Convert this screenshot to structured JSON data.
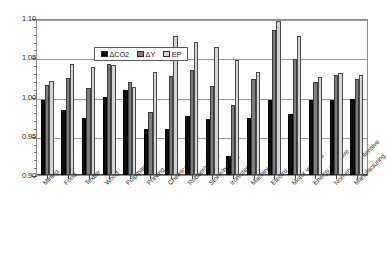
{
  "chart_data": {
    "type": "bar",
    "title": "",
    "xlabel": "",
    "ylabel": "",
    "ylim": [
      0.9,
      1.1
    ],
    "ytick_labels": [
      "1.10",
      "1.05",
      "1.00",
      "0.95",
      "0.90"
    ],
    "ytick_values": [
      1.1,
      1.05,
      1.0,
      0.95,
      0.9
    ],
    "grid": true,
    "legend_position": "top-left-inside",
    "categories": [
      "Mining",
      "Food",
      "Textile",
      "Wood",
      "Pulp/paper",
      "Printing",
      "Chemical",
      "Rubber/plastic",
      "Stone/mineral",
      "Iron/steel",
      "Machinery",
      "Electro",
      "Motor vehicles",
      "Energy intensive",
      "Non-energy intensive",
      "Manufacturing"
    ],
    "series": [
      {
        "name": "ΔCO2",
        "color": "#0d0d0d",
        "values": [
          0.996,
          0.983,
          0.972,
          1.0,
          1.008,
          0.959,
          0.958,
          0.975,
          0.971,
          0.924,
          0.973,
          0.996,
          0.978,
          0.996,
          0.996,
          0.997
        ]
      },
      {
        "name": "ΔY",
        "color": "#7d7d7d",
        "values": [
          1.015,
          1.023,
          1.011,
          1.041,
          1.019,
          0.98,
          1.026,
          1.034,
          1.014,
          0.989,
          1.022,
          1.085,
          1.048,
          1.018,
          1.028,
          1.022
        ]
      },
      {
        "name": "EP",
        "color": "#d4d4d4",
        "values": [
          1.02,
          1.041,
          1.038,
          1.04,
          1.012,
          1.031,
          1.077,
          1.069,
          1.063,
          1.046,
          1.031,
          1.096,
          1.077,
          1.025,
          1.03,
          1.027
        ]
      }
    ],
    "legend": [
      "ΔCO2",
      "ΔY",
      "EP"
    ]
  }
}
